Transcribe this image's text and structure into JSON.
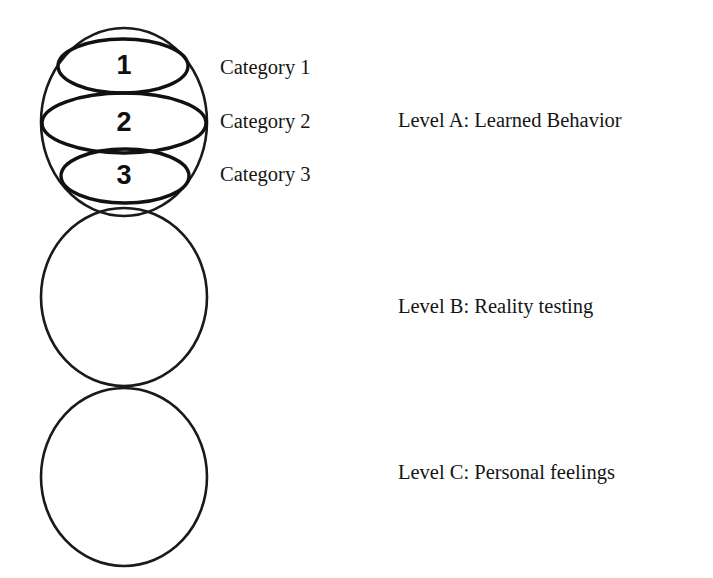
{
  "diagram": {
    "background_color": "#ffffff",
    "stroke_color": "#1a1a1a",
    "circles": [
      {
        "id": "level-a",
        "cx": 124,
        "cy": 122,
        "rx": 83,
        "ry": 94,
        "subdivided": true
      },
      {
        "id": "level-b",
        "cx": 124,
        "cy": 297,
        "rx": 83,
        "ry": 89,
        "subdivided": false
      },
      {
        "id": "level-c",
        "cx": 124,
        "cy": 477,
        "rx": 83,
        "ry": 89,
        "subdivided": false
      }
    ],
    "segments": [
      {
        "number": "1",
        "cx": 123,
        "cy": 66,
        "rx": 65,
        "ry": 27,
        "label": "Category 1",
        "label_x": 220,
        "label_y": 57
      },
      {
        "number": "2",
        "cx": 124,
        "cy": 123,
        "rx": 82,
        "ry": 30,
        "label": "Category 2",
        "label_x": 220,
        "label_y": 111
      },
      {
        "number": "3",
        "cx": 125,
        "cy": 176,
        "rx": 64,
        "ry": 27,
        "label": "Category 3",
        "label_x": 220,
        "label_y": 164
      }
    ],
    "levels": [
      {
        "key": "a",
        "text": "Level A: Learned Behavior",
        "x": 398,
        "y": 110
      },
      {
        "key": "b",
        "text": "Level B: Reality testing",
        "x": 398,
        "y": 296
      },
      {
        "key": "c",
        "text": "Level C: Personal feelings",
        "x": 398,
        "y": 462
      }
    ]
  },
  "segment_numbers": {
    "one": "1",
    "two": "2",
    "three": "3"
  },
  "categories": {
    "one": "Category 1",
    "two": "Category 2",
    "three": "Category 3"
  },
  "levels": {
    "a": "Level A: Learned Behavior",
    "b": "Level B: Reality testing",
    "c": "Level C: Personal feelings"
  }
}
